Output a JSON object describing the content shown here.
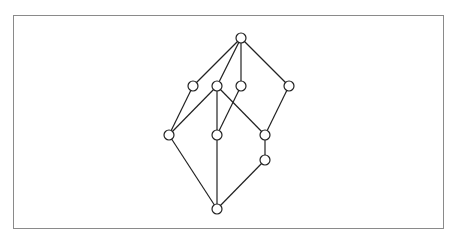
{
  "diagram": {
    "type": "hasse-diagram",
    "frame_color": "#8a8a8a",
    "node_radius": 5,
    "nodes": [
      {
        "id": "top",
        "x": 241,
        "y": 38
      },
      {
        "id": "a1",
        "x": 193,
        "y": 86
      },
      {
        "id": "a2",
        "x": 217,
        "y": 86
      },
      {
        "id": "a3",
        "x": 241,
        "y": 86
      },
      {
        "id": "a4",
        "x": 289,
        "y": 86
      },
      {
        "id": "b1",
        "x": 169,
        "y": 135
      },
      {
        "id": "b2",
        "x": 217,
        "y": 135
      },
      {
        "id": "b3",
        "x": 265,
        "y": 135
      },
      {
        "id": "c1",
        "x": 265,
        "y": 160
      },
      {
        "id": "bottom",
        "x": 217,
        "y": 209
      }
    ],
    "edges": [
      [
        "top",
        "a1"
      ],
      [
        "top",
        "a2"
      ],
      [
        "top",
        "a3"
      ],
      [
        "top",
        "a4"
      ],
      [
        "a1",
        "b1"
      ],
      [
        "a2",
        "b1"
      ],
      [
        "a2",
        "b2"
      ],
      [
        "a2",
        "b3"
      ],
      [
        "a3",
        "b2"
      ],
      [
        "a4",
        "b3"
      ],
      [
        "b3",
        "c1"
      ],
      [
        "b1",
        "bottom"
      ],
      [
        "b2",
        "bottom"
      ],
      [
        "c1",
        "bottom"
      ]
    ]
  }
}
